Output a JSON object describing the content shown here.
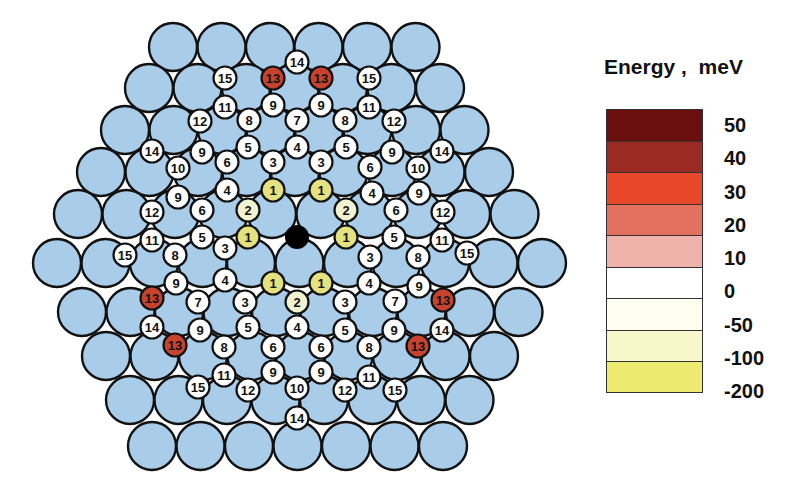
{
  "colors": {
    "substrate": "#a9cce9",
    "center_adatom": "#000000",
    "outline": "#111111"
  },
  "legend": {
    "title": "Energy ,  meV",
    "bins": [
      {
        "label": "50",
        "color": "#6b0e0e"
      },
      {
        "label": "40",
        "color": "#9a2a22"
      },
      {
        "label": "30",
        "color": "#e8472a"
      },
      {
        "label": "20",
        "color": "#e4705f"
      },
      {
        "label": "10",
        "color": "#f0b3ac"
      },
      {
        "label": "0",
        "color": "#ffffff"
      },
      {
        "label": "-50",
        "color": "#fefdf0"
      },
      {
        "label": "-100",
        "color": "#f8f7cc"
      },
      {
        "label": "-200",
        "color": "#ecea70"
      }
    ]
  },
  "site_colors": {
    "1": "#e3e27e",
    "2": "#f1f2cf",
    "13": "#c8432e",
    "default": "#ffffff"
  },
  "substrate_rows": [
    {
      "y": 47,
      "x0": 173,
      "count": 6
    },
    {
      "y": 88,
      "x0": 149,
      "count": 7
    },
    {
      "y": 130,
      "x0": 125,
      "count": 8
    },
    {
      "y": 172,
      "x0": 101,
      "count": 9
    },
    {
      "y": 214,
      "x0": 78,
      "count": 10
    },
    {
      "y": 263,
      "x0": 57,
      "count": 11
    },
    {
      "y": 312,
      "x0": 82,
      "count": 10
    },
    {
      "y": 356,
      "x0": 106,
      "count": 9
    },
    {
      "y": 400,
      "x0": 130,
      "count": 8
    },
    {
      "y": 446,
      "x0": 152,
      "count": 7
    }
  ],
  "substrate_spacing": 48.5,
  "substrate_radius": 24,
  "center": {
    "x": 297,
    "y": 237,
    "r": 12
  },
  "site_radius": 11.5,
  "sites": [
    {
      "x": 297,
      "y": 62,
      "n": "14"
    },
    {
      "x": 225,
      "y": 78,
      "n": "15"
    },
    {
      "x": 273,
      "y": 78,
      "n": "13"
    },
    {
      "x": 321,
      "y": 78,
      "n": "13"
    },
    {
      "x": 369,
      "y": 78,
      "n": "15"
    },
    {
      "x": 225,
      "y": 107,
      "n": "11"
    },
    {
      "x": 273,
      "y": 105,
      "n": "9"
    },
    {
      "x": 321,
      "y": 105,
      "n": "9"
    },
    {
      "x": 369,
      "y": 107,
      "n": "11"
    },
    {
      "x": 200,
      "y": 121,
      "n": "12"
    },
    {
      "x": 249,
      "y": 120,
      "n": "8"
    },
    {
      "x": 297,
      "y": 120,
      "n": "7"
    },
    {
      "x": 345,
      "y": 120,
      "n": "8"
    },
    {
      "x": 394,
      "y": 121,
      "n": "12"
    },
    {
      "x": 152,
      "y": 151,
      "n": "14"
    },
    {
      "x": 202,
      "y": 152,
      "n": "9"
    },
    {
      "x": 248,
      "y": 147,
      "n": "5"
    },
    {
      "x": 297,
      "y": 147,
      "n": "4"
    },
    {
      "x": 346,
      "y": 147,
      "n": "5"
    },
    {
      "x": 392,
      "y": 152,
      "n": "9"
    },
    {
      "x": 442,
      "y": 151,
      "n": "14"
    },
    {
      "x": 178,
      "y": 168,
      "n": "10"
    },
    {
      "x": 227,
      "y": 162,
      "n": "6"
    },
    {
      "x": 273,
      "y": 162,
      "n": "3"
    },
    {
      "x": 321,
      "y": 162,
      "n": "3"
    },
    {
      "x": 370,
      "y": 167,
      "n": "6"
    },
    {
      "x": 418,
      "y": 168,
      "n": "10"
    },
    {
      "x": 178,
      "y": 197,
      "n": "9"
    },
    {
      "x": 227,
      "y": 190,
      "n": "4"
    },
    {
      "x": 273,
      "y": 190,
      "n": "1"
    },
    {
      "x": 321,
      "y": 190,
      "n": "1"
    },
    {
      "x": 372,
      "y": 193,
      "n": "4"
    },
    {
      "x": 419,
      "y": 193,
      "n": "9"
    },
    {
      "x": 152,
      "y": 212,
      "n": "12"
    },
    {
      "x": 202,
      "y": 210,
      "n": "6"
    },
    {
      "x": 248,
      "y": 210,
      "n": "2"
    },
    {
      "x": 346,
      "y": 210,
      "n": "2"
    },
    {
      "x": 396,
      "y": 210,
      "n": "6"
    },
    {
      "x": 443,
      "y": 212,
      "n": "12"
    },
    {
      "x": 152,
      "y": 240,
      "n": "11"
    },
    {
      "x": 202,
      "y": 237,
      "n": "5"
    },
    {
      "x": 248,
      "y": 237,
      "n": "1"
    },
    {
      "x": 346,
      "y": 237,
      "n": "1"
    },
    {
      "x": 394,
      "y": 237,
      "n": "5"
    },
    {
      "x": 442,
      "y": 240,
      "n": "11"
    },
    {
      "x": 125,
      "y": 255,
      "n": "15"
    },
    {
      "x": 175,
      "y": 255,
      "n": "8"
    },
    {
      "x": 225,
      "y": 248,
      "n": "3"
    },
    {
      "x": 370,
      "y": 257,
      "n": "3"
    },
    {
      "x": 418,
      "y": 257,
      "n": "8"
    },
    {
      "x": 467,
      "y": 253,
      "n": "15"
    },
    {
      "x": 176,
      "y": 283,
      "n": "9"
    },
    {
      "x": 225,
      "y": 280,
      "n": "4"
    },
    {
      "x": 273,
      "y": 283,
      "n": "1"
    },
    {
      "x": 321,
      "y": 283,
      "n": "1"
    },
    {
      "x": 369,
      "y": 283,
      "n": "4"
    },
    {
      "x": 419,
      "y": 286,
      "n": "9"
    },
    {
      "x": 152,
      "y": 298,
      "n": "13"
    },
    {
      "x": 198,
      "y": 302,
      "n": "7"
    },
    {
      "x": 245,
      "y": 302,
      "n": "3"
    },
    {
      "x": 297,
      "y": 302,
      "n": "2"
    },
    {
      "x": 345,
      "y": 302,
      "n": "3"
    },
    {
      "x": 395,
      "y": 301,
      "n": "7"
    },
    {
      "x": 443,
      "y": 300,
      "n": "13"
    },
    {
      "x": 152,
      "y": 327,
      "n": "14"
    },
    {
      "x": 200,
      "y": 330,
      "n": "9"
    },
    {
      "x": 248,
      "y": 327,
      "n": "5"
    },
    {
      "x": 297,
      "y": 327,
      "n": "4"
    },
    {
      "x": 345,
      "y": 330,
      "n": "5"
    },
    {
      "x": 394,
      "y": 330,
      "n": "9"
    },
    {
      "x": 442,
      "y": 330,
      "n": "14"
    },
    {
      "x": 175,
      "y": 345,
      "n": "13"
    },
    {
      "x": 224,
      "y": 347,
      "n": "8"
    },
    {
      "x": 273,
      "y": 347,
      "n": "6"
    },
    {
      "x": 321,
      "y": 347,
      "n": "6"
    },
    {
      "x": 369,
      "y": 347,
      "n": "8"
    },
    {
      "x": 418,
      "y": 346,
      "n": "13"
    },
    {
      "x": 224,
      "y": 375,
      "n": "11"
    },
    {
      "x": 273,
      "y": 372,
      "n": "9"
    },
    {
      "x": 321,
      "y": 372,
      "n": "9"
    },
    {
      "x": 369,
      "y": 377,
      "n": "11"
    },
    {
      "x": 198,
      "y": 387,
      "n": "15"
    },
    {
      "x": 248,
      "y": 390,
      "n": "12"
    },
    {
      "x": 297,
      "y": 388,
      "n": "10"
    },
    {
      "x": 345,
      "y": 390,
      "n": "12"
    },
    {
      "x": 395,
      "y": 390,
      "n": "15"
    },
    {
      "x": 297,
      "y": 418,
      "n": "14"
    }
  ]
}
